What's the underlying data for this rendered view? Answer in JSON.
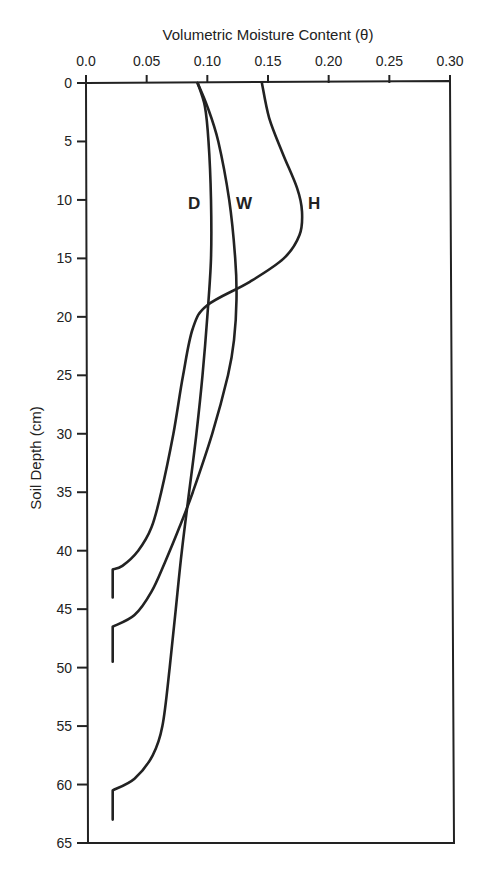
{
  "chart_data": {
    "type": "line",
    "title": "Volumetric Moisture Content (θ)",
    "xlabel": "Volumetric Moisture Content (θ)",
    "ylabel": "Soil Depth (cm)",
    "x_axis_position": "top",
    "y_axis_inverted": true,
    "xlim": [
      0.0,
      0.3
    ],
    "ylim": [
      0,
      65
    ],
    "x_ticks": [
      "0.0",
      "0.05",
      "0.10",
      "0.15",
      "0.20",
      "0.25",
      "0.30"
    ],
    "y_ticks": [
      "0",
      "5",
      "10",
      "15",
      "20",
      "25",
      "30",
      "35",
      "40",
      "45",
      "50",
      "55",
      "60",
      "65"
    ],
    "grid": false,
    "legend": "inline labels D, W, H near depth 10 cm",
    "series": [
      {
        "name": "D",
        "points": [
          {
            "depth": 0,
            "theta": 0.092
          },
          {
            "depth": 2,
            "theta": 0.098
          },
          {
            "depth": 5,
            "theta": 0.101
          },
          {
            "depth": 10,
            "theta": 0.103
          },
          {
            "depth": 15,
            "theta": 0.103
          },
          {
            "depth": 20,
            "theta": 0.1
          },
          {
            "depth": 25,
            "theta": 0.096
          },
          {
            "depth": 30,
            "theta": 0.091
          },
          {
            "depth": 35,
            "theta": 0.085
          },
          {
            "depth": 40,
            "theta": 0.079
          },
          {
            "depth": 45,
            "theta": 0.074
          },
          {
            "depth": 50,
            "theta": 0.069
          },
          {
            "depth": 55,
            "theta": 0.063
          },
          {
            "depth": 57.5,
            "theta": 0.055
          },
          {
            "depth": 59.5,
            "theta": 0.04
          },
          {
            "depth": 60.5,
            "theta": 0.022
          },
          {
            "depth": 63,
            "theta": 0.022
          }
        ]
      },
      {
        "name": "W",
        "points": [
          {
            "depth": 0,
            "theta": 0.092
          },
          {
            "depth": 2,
            "theta": 0.1
          },
          {
            "depth": 5,
            "theta": 0.109
          },
          {
            "depth": 10,
            "theta": 0.118
          },
          {
            "depth": 15,
            "theta": 0.123
          },
          {
            "depth": 18.5,
            "theta": 0.124
          },
          {
            "depth": 22,
            "theta": 0.122
          },
          {
            "depth": 25,
            "theta": 0.117
          },
          {
            "depth": 30,
            "theta": 0.104
          },
          {
            "depth": 35,
            "theta": 0.088
          },
          {
            "depth": 38,
            "theta": 0.077
          },
          {
            "depth": 41,
            "theta": 0.065
          },
          {
            "depth": 43.5,
            "theta": 0.054
          },
          {
            "depth": 45.5,
            "theta": 0.04
          },
          {
            "depth": 46.5,
            "theta": 0.022
          },
          {
            "depth": 49.5,
            "theta": 0.022
          }
        ]
      },
      {
        "name": "H",
        "points": [
          {
            "depth": 0,
            "theta": 0.145
          },
          {
            "depth": 3,
            "theta": 0.151
          },
          {
            "depth": 6,
            "theta": 0.162
          },
          {
            "depth": 9,
            "theta": 0.174
          },
          {
            "depth": 11,
            "theta": 0.178
          },
          {
            "depth": 13,
            "theta": 0.176
          },
          {
            "depth": 15,
            "theta": 0.163
          },
          {
            "depth": 17,
            "theta": 0.135
          },
          {
            "depth": 19,
            "theta": 0.1
          },
          {
            "depth": 21,
            "theta": 0.088
          },
          {
            "depth": 25,
            "theta": 0.08
          },
          {
            "depth": 30,
            "theta": 0.072
          },
          {
            "depth": 35,
            "theta": 0.062
          },
          {
            "depth": 38,
            "theta": 0.054
          },
          {
            "depth": 40,
            "theta": 0.043
          },
          {
            "depth": 41.3,
            "theta": 0.03
          },
          {
            "depth": 41.6,
            "theta": 0.022
          },
          {
            "depth": 44,
            "theta": 0.022
          }
        ]
      }
    ]
  },
  "labels": {
    "title": "Volumetric Moisture Content (θ)",
    "y_axis": "Soil Depth (cm)",
    "series_D": "D",
    "series_W": "W",
    "series_H": "H"
  }
}
